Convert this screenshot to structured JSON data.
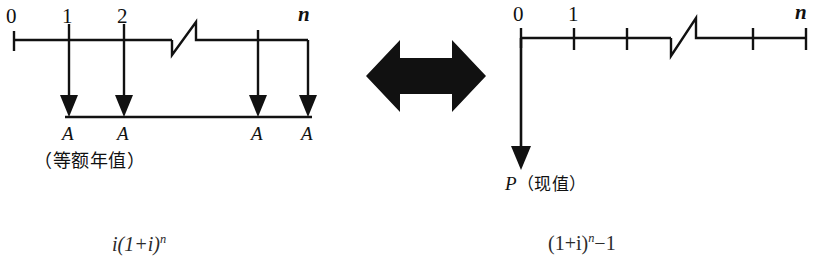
{
  "figure": {
    "background": "#ffffff",
    "ink": "#111111"
  },
  "left_diagram": {
    "name": "annual-series-cash-flow",
    "timeline_labels": [
      "0",
      "1",
      "2",
      "n"
    ],
    "cash_flow_labels": [
      "A",
      "A",
      "A",
      "A"
    ],
    "caption": "（等额年值）",
    "arrow_direction": "down",
    "break_symbol": "zigzag"
  },
  "equivalence": {
    "symbol": "double-headed-arrow",
    "meaning": "equivalent to",
    "color": "#111111"
  },
  "right_diagram": {
    "name": "present-value-cash-flow",
    "timeline_labels": [
      "0",
      "1",
      "n"
    ],
    "value_label": "P",
    "value_caption": "（现值）",
    "arrow_direction": "down",
    "break_symbol": "zigzag"
  },
  "formulas": {
    "left_partial": "i(1+i)",
    "left_partial_exp": "n",
    "right_partial_open": "(1+i)",
    "right_partial_exp": "n",
    "right_partial_tail": "−1"
  }
}
